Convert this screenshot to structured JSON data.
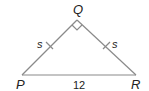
{
  "diagram": {
    "type": "right isosceles triangle",
    "stroke_color": "#8a8a8a",
    "text_color": "#222222",
    "vertices": [
      {
        "name": "P",
        "label": "P",
        "x": 22,
        "y": 75
      },
      {
        "name": "Q",
        "label": "Q",
        "x": 77,
        "y": 20
      },
      {
        "name": "R",
        "label": "R",
        "x": 136,
        "y": 75
      }
    ],
    "right_angle_at": "Q",
    "sides": {
      "PQ": {
        "label": "s",
        "tick_marks": 1
      },
      "QR": {
        "label": "s",
        "tick_marks": 1
      },
      "PR": {
        "label": "12"
      }
    }
  }
}
